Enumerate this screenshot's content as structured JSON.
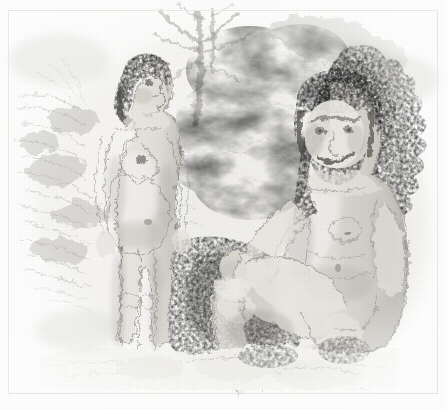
{
  "image": {
    "kind": "pencil-illustration",
    "medium": "graphite pencil drawing",
    "title": "Two hominids in a wooded setting",
    "paper_color": "#fdfdfc",
    "ink_color": "#6b6963",
    "shadow_color": "#3c3a36",
    "deep_shadow_color": "#262421",
    "width": 447,
    "height": 409,
    "border": {
      "visible": true,
      "color": "#e7e7e4",
      "x": 8,
      "y": 10,
      "w": 430,
      "h": 384
    }
  },
  "scene": {
    "setting_label": "wooded clearing with rock outcrop",
    "ground_label": "pale ground / foreground rocks",
    "background_elements": [
      {
        "name": "tree-trunk",
        "label": "branching tree trunk",
        "x": 190,
        "y": 12,
        "w": 70,
        "h": 120
      },
      {
        "name": "left-foliage",
        "label": "light sketched foliage, left",
        "x": 14,
        "y": 60,
        "w": 110,
        "h": 230
      },
      {
        "name": "rock-cloud-mass",
        "label": "pale rock and cloud mass, centre",
        "x": 180,
        "y": 20,
        "w": 160,
        "h": 190
      },
      {
        "name": "right-foliage",
        "label": "dark jagged foliage mass, right",
        "x": 352,
        "y": 40,
        "w": 78,
        "h": 300
      },
      {
        "name": "central-shadow",
        "label": "dark shaded undergrowth, centre-bottom",
        "x": 160,
        "y": 240,
        "w": 160,
        "h": 130
      }
    ]
  },
  "figures": [
    {
      "name": "standing-female-figure",
      "label": "Standing hominid female in right profile",
      "pose": "standing, facing right, arms at sides",
      "head": {
        "x": 125,
        "y": 60,
        "w": 46,
        "h": 50,
        "label": "head in profile with dark curly hair"
      },
      "torso": {
        "x": 105,
        "y": 108,
        "w": 60,
        "h": 105,
        "label": "torso with pendulous breast and rounded abdomen"
      },
      "legs": {
        "x": 100,
        "y": 205,
        "w": 60,
        "h": 150,
        "label": "legs, slightly apart"
      },
      "bbox": {
        "x": 95,
        "y": 55,
        "w": 85,
        "h": 305
      }
    },
    {
      "name": "seated-male-figure",
      "label": "Seated bearded hominid male facing viewer",
      "pose": "seated on rock, legs crossed, hands resting on knee",
      "head": {
        "x": 292,
        "y": 82,
        "w": 88,
        "h": 92,
        "label": "bearded head with heavy brow ridges, looking left"
      },
      "torso": {
        "x": 290,
        "y": 165,
        "w": 110,
        "h": 115,
        "label": "broad torso and chest"
      },
      "arms": {
        "x": 200,
        "y": 230,
        "w": 190,
        "h": 110,
        "label": "arms reaching down to crossed knee"
      },
      "legs": {
        "x": 195,
        "y": 245,
        "w": 200,
        "h": 140,
        "label": "crossed legs"
      },
      "bbox": {
        "x": 190,
        "y": 80,
        "w": 215,
        "h": 310
      }
    }
  ],
  "annotations": {
    "caption": "",
    "labels": []
  }
}
